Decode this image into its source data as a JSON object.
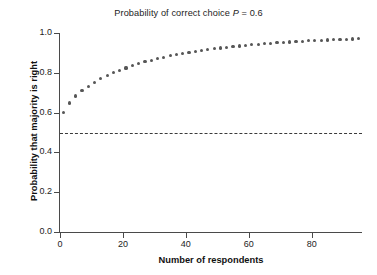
{
  "chart_data": {
    "type": "scatter",
    "title": "Probability of correct choice P = 0.6",
    "title_prefix": "Probability of correct choice ",
    "title_symbol": "P",
    "title_suffix": " = 0.6",
    "xlabel": "Number of respondents",
    "ylabel": "Probability that majority is right",
    "xlim": [
      0,
      96
    ],
    "ylim": [
      0,
      1
    ],
    "xticks": [
      0,
      20,
      40,
      60,
      80
    ],
    "xticklabels": [
      "0",
      "20",
      "40",
      "60",
      "80"
    ],
    "yticks": [
      0.0,
      0.2,
      0.4,
      0.6,
      0.8,
      1.0
    ],
    "yticklabels": [
      "0.0",
      "0.2",
      "0.4",
      "0.6",
      "0.8",
      "1.0"
    ],
    "grid": false,
    "legend": "none",
    "marker_color": "#565656",
    "axis_color": "#4a4a4a",
    "reference_line": {
      "y": 0.5,
      "style": "dashed",
      "color": "#3b3b3b",
      "label": ""
    },
    "series": [
      {
        "name": "Probability majority correct (P = 0.6)",
        "x": [
          1,
          3,
          5,
          7,
          9,
          11,
          13,
          15,
          17,
          19,
          21,
          23,
          25,
          27,
          29,
          31,
          33,
          35,
          37,
          39,
          41,
          43,
          45,
          47,
          49,
          51,
          53,
          55,
          57,
          59,
          61,
          63,
          65,
          67,
          69,
          71,
          73,
          75,
          77,
          79,
          81,
          83,
          85,
          87,
          89,
          91,
          93,
          95
        ],
        "values": [
          0.6,
          0.648,
          0.683,
          0.71,
          0.733,
          0.753,
          0.77,
          0.787,
          0.8,
          0.813,
          0.824,
          0.835,
          0.846,
          0.855,
          0.863,
          0.871,
          0.878,
          0.885,
          0.891,
          0.897,
          0.902,
          0.908,
          0.912,
          0.917,
          0.921,
          0.925,
          0.929,
          0.932,
          0.935,
          0.938,
          0.941,
          0.944,
          0.946,
          0.949,
          0.951,
          0.953,
          0.955,
          0.957,
          0.959,
          0.961,
          0.962,
          0.964,
          0.965,
          0.967,
          0.968,
          0.969,
          0.97,
          0.972
        ]
      }
    ]
  }
}
